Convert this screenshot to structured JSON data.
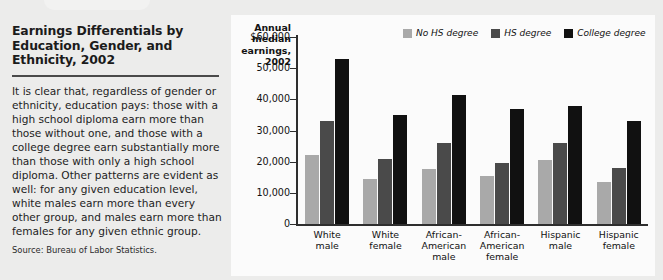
{
  "headline": "Earnings Differentials by Education, Gender, and Ethnicity, 2002",
  "body": "It is clear that, regardless of gender or ethnicity, education pays: those with a high school diploma earn more than those without one, and those with a college degree earn substantially more than those with only a high school diploma. Other patterns are evident as well: for any given education level, white males earn more than every other group, and males earn more than females for any given ethnic group.",
  "source": "Source: Bureau of Labor Statistics.",
  "chart_data": {
    "type": "bar",
    "title": "",
    "ylabel": "Annual median earnings, 2002",
    "xlabel": "",
    "ylim": [
      0,
      60000
    ],
    "ytick_labels": [
      "$60,000",
      "50,000",
      "40,000",
      "30,000",
      "20,000",
      "10,000",
      "0"
    ],
    "ytick_values": [
      60000,
      50000,
      40000,
      30000,
      20000,
      10000,
      0
    ],
    "grid": false,
    "legend_position": "top-right",
    "categories": [
      "White male",
      "White female",
      "African-American male",
      "African-American female",
      "Hispanic male",
      "Hispanic female"
    ],
    "category_lines": [
      [
        "White",
        "male"
      ],
      [
        "White",
        "female"
      ],
      [
        "African-",
        "American",
        "male"
      ],
      [
        "African-",
        "American",
        "female"
      ],
      [
        "Hispanic",
        "male"
      ],
      [
        "Hispanic",
        "female"
      ]
    ],
    "series": [
      {
        "name": "No HS degree",
        "color": "#a9a9a9",
        "values": [
          22000,
          14500,
          17500,
          15500,
          20500,
          13500
        ]
      },
      {
        "name": "HS degree",
        "color": "#4a4a4a",
        "values": [
          33000,
          21000,
          26000,
          19500,
          26000,
          18000
        ]
      },
      {
        "name": "College degree",
        "color": "#111111",
        "values": [
          53000,
          35000,
          41500,
          37000,
          38000,
          33000
        ]
      }
    ]
  }
}
